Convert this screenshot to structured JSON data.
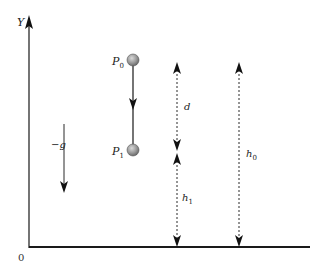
{
  "diagram": {
    "type": "physics free-fall diagram",
    "axis": {
      "y_label": "Y",
      "origin_label": "0"
    },
    "gravity": {
      "label": "−g"
    },
    "points": [
      {
        "name": "P",
        "subscript": "0"
      },
      {
        "name": "P",
        "subscript": "1"
      }
    ],
    "distances": {
      "d": {
        "label": "d"
      },
      "h1": {
        "label": "h",
        "subscript": "1"
      },
      "h0": {
        "label": "h",
        "subscript": "0"
      }
    },
    "colors": {
      "line": "#2a2a2a",
      "ball": "#9a9a9a",
      "background": "#ffffff"
    }
  }
}
